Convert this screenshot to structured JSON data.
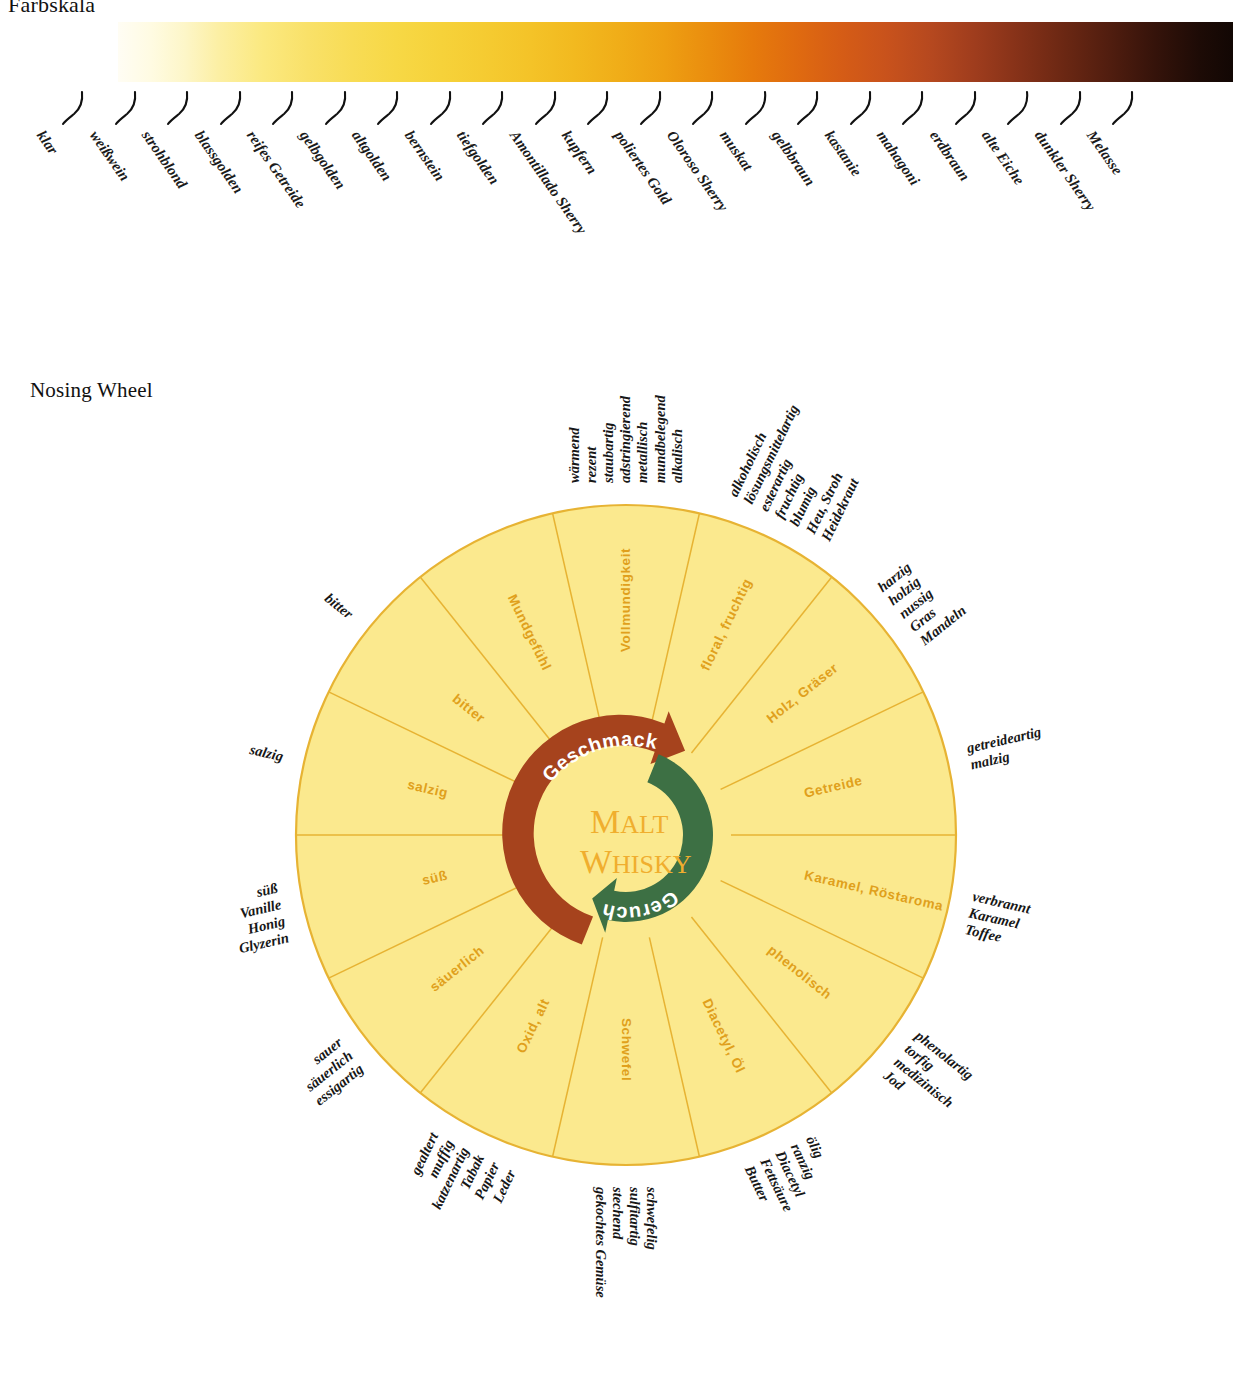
{
  "sections": {
    "colour_scale_title": "Farbskala",
    "nosing_wheel_title": "Nosing Wheel"
  },
  "colour_scale": {
    "labels": [
      "klar",
      "weißwein",
      "strohblond",
      "blassgolden",
      "reifes Getreide",
      "gelbgolden",
      "altgolden",
      "bernstein",
      "tiefgolden",
      "Amontillado Sherry",
      "kupfern",
      "poliertes Gold",
      "Oloroso Sherry",
      "muskat",
      "gelbbraun",
      "kastanie",
      "mahagoni",
      "erdbraun",
      "alte Eiche",
      "dunkler Sherry",
      "Melasse"
    ],
    "gradient_stops": [
      "#fffdf4",
      "#fbe980",
      "#f6d23a",
      "#f0ad18",
      "#e67a0c",
      "#c8521c",
      "#843118",
      "#35130a",
      "#120704"
    ]
  },
  "wheel": {
    "center_line1": "Malt",
    "center_line2": "Whisky",
    "center_color": "#f0ae2e",
    "taste_arrow": {
      "label": "Geschmack",
      "color": "#a6431d"
    },
    "nose_arrow": {
      "label": "Geruch",
      "color": "#3d7044"
    },
    "petal_fill": "#fbe98e",
    "petal_stroke": "#e7b333",
    "segment_label_color": "#e0a01c",
    "segments": [
      {
        "name": "Vollmundigkeit",
        "inner_label": "Vollmundigkeit",
        "outer": [
          "wärmend",
          "rezent",
          "staubartig",
          "adstringierend",
          "metallisch",
          "mundbelegend",
          "alkalisch"
        ]
      },
      {
        "name": "floral-fruchtig",
        "inner_label": "floral, fruchtig",
        "outer": [
          "alkoholisch",
          "lösungsmittelartig",
          "esterartig",
          "fruchtig",
          "blumig",
          "Heu, Stroh",
          "Heidekraut"
        ]
      },
      {
        "name": "Holz-Graeser",
        "inner_label": "Holz, Gräser",
        "outer": [
          "harzig",
          "holzig",
          "nussig",
          "Gras",
          "Mandeln"
        ]
      },
      {
        "name": "Getreide",
        "inner_label": "Getreide",
        "outer": [
          "getreideartig",
          "malzig"
        ]
      },
      {
        "name": "Karamel-Roestaroma",
        "inner_label": "Karamel, Röstaroma",
        "outer": [
          "verbrannt",
          "Karamel",
          "Toffee"
        ]
      },
      {
        "name": "phenolisch",
        "inner_label": "phenolisch",
        "outer": [
          "phenolartig",
          "torfig",
          "medizinisch",
          "Jod"
        ]
      },
      {
        "name": "Diacetyl-Oel",
        "inner_label": "Diacetyl, Öl",
        "outer": [
          "ölig",
          "ranzig",
          "Diacetyl",
          "Fettsäure",
          "Butter"
        ]
      },
      {
        "name": "Schwefel",
        "inner_label": "Schwefel",
        "outer": [
          "schwefelig",
          "sulfitartig",
          "stechend",
          "gekochtes Gemüse"
        ]
      },
      {
        "name": "Oxid-alt",
        "inner_label": "Oxid, alt",
        "outer": [
          "gealtert",
          "muffig",
          "katzenartig",
          "Tabak",
          "Papier",
          "Leder"
        ]
      },
      {
        "name": "saeuerlich",
        "inner_label": "säuerlich",
        "outer": [
          "sauer",
          "säuerlich",
          "essigartig"
        ]
      },
      {
        "name": "suess",
        "inner_label": "süß",
        "outer": [
          "süß",
          "Vanille",
          "Honig",
          "Glyzerin"
        ]
      },
      {
        "name": "salzig",
        "inner_label": "salzig",
        "outer": [
          "salzig"
        ]
      },
      {
        "name": "bitter",
        "inner_label": "bitter",
        "outer": [
          "bitter"
        ]
      },
      {
        "name": "Mundgefuehl",
        "inner_label": "Mundgefühl",
        "outer": []
      }
    ]
  }
}
